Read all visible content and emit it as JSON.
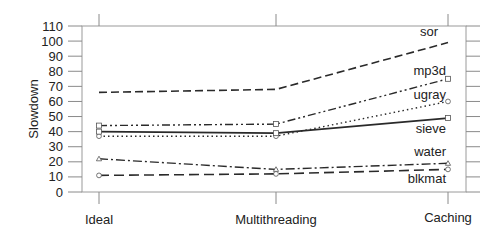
{
  "chart_data": {
    "type": "line",
    "title": "",
    "xlabel": "",
    "ylabel": "Slowdown",
    "ylim": [
      0,
      110
    ],
    "yticks": [
      0,
      10,
      20,
      30,
      40,
      50,
      60,
      70,
      80,
      90,
      100,
      110
    ],
    "grid": false,
    "legend_position": "inline labels at right end of lines",
    "categories": [
      "Ideal",
      "Multithreading",
      "Caching"
    ],
    "series": [
      {
        "name": "sor",
        "values": [
          66,
          68,
          99
        ],
        "dash": "8,4",
        "marker": "none",
        "stroke_width": 1.6
      },
      {
        "name": "mp3d",
        "values": [
          44,
          45,
          75
        ],
        "dash": "8,3,2,3,2,3",
        "marker": "square",
        "stroke_width": 1.4
      },
      {
        "name": "ugray",
        "values": [
          37,
          37,
          60
        ],
        "dash": "1.5,3",
        "marker": "circle",
        "stroke_width": 1.4
      },
      {
        "name": "sieve",
        "values": [
          40,
          39,
          49
        ],
        "dash": "",
        "marker": "square",
        "stroke_width": 1.6
      },
      {
        "name": "water",
        "values": [
          22,
          15,
          19
        ],
        "dash": "9,3,2,3",
        "marker": "triangle",
        "stroke_width": 1.4
      },
      {
        "name": "blkmat",
        "values": [
          11,
          12,
          15
        ],
        "dash": "10,5",
        "marker": "circle",
        "stroke_width": 1.6
      }
    ]
  },
  "labels": {
    "ylabel": "Slowdown",
    "categories": [
      "Ideal",
      "Multithreading",
      "Caching"
    ],
    "series_labels": {
      "sor": "sor",
      "mp3d": "mp3d",
      "ugray": "ugray",
      "sieve": "sieve",
      "water": "water",
      "blkmat": "blkmat"
    },
    "yticks": [
      "0",
      "10",
      "20",
      "30",
      "40",
      "50",
      "60",
      "70",
      "80",
      "90",
      "100",
      "110"
    ]
  },
  "colors": {
    "line": "#2a2a2a",
    "frame": "#9a9a9a",
    "text": "#222222"
  }
}
